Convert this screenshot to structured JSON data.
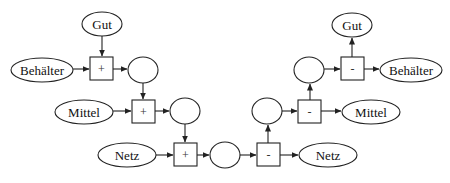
{
  "diagram": {
    "left_inputs": [
      {
        "id": "in-gut",
        "label": "Gut",
        "cx": 102,
        "cy": 24,
        "rx": 20,
        "ry": 12
      },
      {
        "id": "in-behaelter",
        "label": "Behälter",
        "cx": 42,
        "cy": 70,
        "rx": 31,
        "ry": 12
      },
      {
        "id": "in-mittel",
        "label": "Mittel",
        "cx": 84,
        "cy": 112,
        "rx": 29,
        "ry": 12
      },
      {
        "id": "in-netz",
        "label": "Netz",
        "cx": 127,
        "cy": 155,
        "rx": 29,
        "ry": 12
      }
    ],
    "right_outputs": [
      {
        "id": "out-gut",
        "label": "Gut",
        "cx": 352,
        "cy": 25,
        "rx": 20,
        "ry": 12
      },
      {
        "id": "out-behaelter",
        "label": "Behälter",
        "cx": 411,
        "cy": 70,
        "rx": 31,
        "ry": 12
      },
      {
        "id": "out-mittel",
        "label": "Mittel",
        "cx": 371,
        "cy": 112,
        "rx": 29,
        "ry": 12
      },
      {
        "id": "out-netz",
        "label": "Netz",
        "cx": 328,
        "cy": 155,
        "rx": 29,
        "ry": 12
      }
    ],
    "operators": [
      {
        "id": "op1",
        "symbol": "+",
        "x": 90,
        "y": 57,
        "w": 23,
        "h": 23
      },
      {
        "id": "op2",
        "symbol": "+",
        "x": 132,
        "y": 100,
        "w": 23,
        "h": 23
      },
      {
        "id": "op3",
        "symbol": "+",
        "x": 174,
        "y": 143,
        "w": 23,
        "h": 23
      },
      {
        "id": "op4",
        "symbol": "-",
        "x": 257,
        "y": 143,
        "w": 23,
        "h": 23
      },
      {
        "id": "op5",
        "symbol": "-",
        "x": 298,
        "y": 100,
        "w": 23,
        "h": 23
      },
      {
        "id": "op6",
        "symbol": "-",
        "x": 341,
        "y": 57,
        "w": 23,
        "h": 23
      }
    ],
    "intermediates": [
      {
        "id": "mid1",
        "cx": 143,
        "cy": 70,
        "rx": 15,
        "ry": 13
      },
      {
        "id": "mid2",
        "cx": 185,
        "cy": 111,
        "rx": 15,
        "ry": 13
      },
      {
        "id": "mid3",
        "cx": 225,
        "cy": 155,
        "rx": 15,
        "ry": 13
      },
      {
        "id": "mid4",
        "cx": 267,
        "cy": 111,
        "rx": 15,
        "ry": 13
      },
      {
        "id": "mid5",
        "cx": 309,
        "cy": 70,
        "rx": 15,
        "ry": 13
      }
    ]
  }
}
